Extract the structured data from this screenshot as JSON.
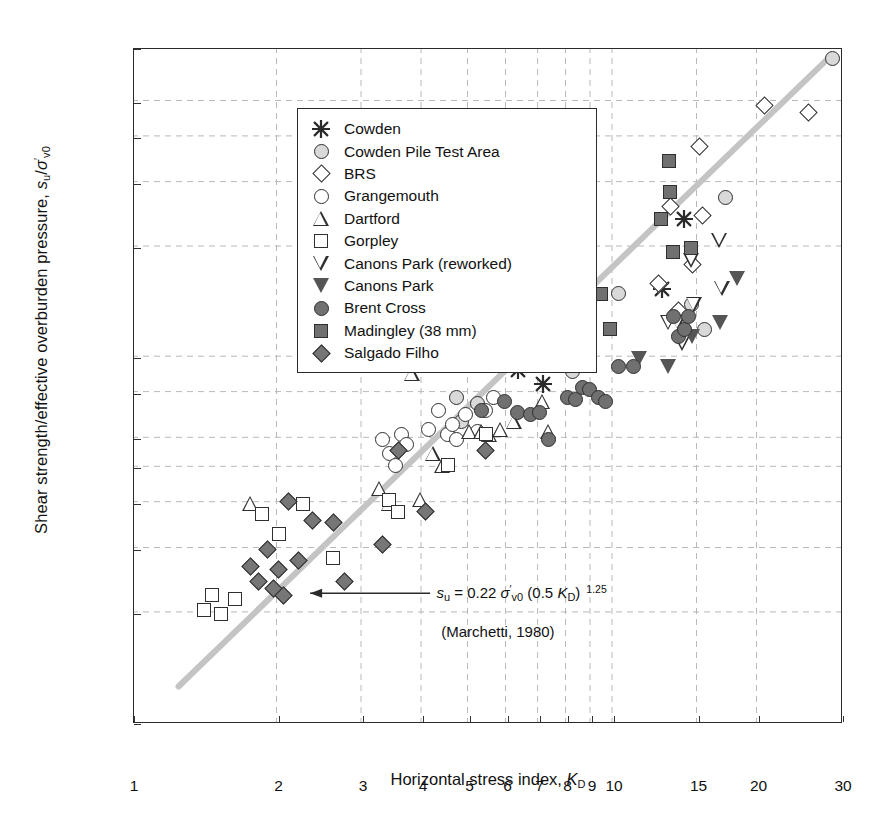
{
  "chart_data": {
    "type": "scatter",
    "title": "",
    "xlabel": "Horizontal stress index, K_D",
    "ylabel": "Shear strength/effective overburden pressure, s_u/sigma'_v0",
    "xscale": "log",
    "yscale": "log",
    "xlim": [
      1,
      30
    ],
    "ylim": [
      0.1,
      7.0
    ],
    "grid": "dashed gridlines at major ticks",
    "legend_position": "upper-left inside axes",
    "xticks": [
      "1",
      "2",
      "3",
      "4",
      "5",
      "6",
      "7",
      "8",
      "9",
      "10",
      "15",
      "20",
      "30"
    ],
    "xtick_values": [
      1,
      2,
      3,
      4,
      5,
      6,
      7,
      8,
      9,
      10,
      15,
      20,
      30
    ],
    "yticks": [
      "0.1",
      "0.2",
      "0.3",
      "0.4",
      "0.5",
      "0.6",
      "0.8",
      "1.0",
      "2.0",
      "3.0",
      "4.0",
      "5.0",
      "7.0"
    ],
    "ytick_values": [
      0.1,
      0.2,
      0.3,
      0.4,
      0.5,
      0.6,
      0.8,
      1.0,
      2.0,
      3.0,
      4.0,
      5.0,
      7.0
    ],
    "annotations": [
      {
        "name": "marchetti-equation",
        "text": "s_u = 0.22 sigma'_v0 (0.5 K_D)^1.25",
        "x": 4.3,
        "y": 0.225
      },
      {
        "name": "marchetti-reference",
        "text": "(Marchetti, 1980)",
        "x": 4.4,
        "y": 0.175
      }
    ],
    "trendline": {
      "name": "Marchetti 1980 correlation",
      "color": "#c4c4c4",
      "x": [
        1.25,
        28.5
      ],
      "y": [
        0.125,
        6.6
      ],
      "equation": "su/sv0 = 0.22 (0.5 KD)^1.25"
    },
    "series": [
      {
        "name": "Cowden",
        "marker": "asterisk",
        "fill": "#3a3a3a",
        "points": [
          [
            5.4,
            1.0
          ],
          [
            6.0,
            1.15
          ],
          [
            6.3,
            0.93
          ],
          [
            6.9,
            1.5
          ],
          [
            7.1,
            0.85
          ],
          [
            12.6,
            1.55
          ],
          [
            14.0,
            2.4
          ]
        ]
      },
      {
        "name": "Cowden Pile Test Area",
        "marker": "circle",
        "fill": "#d9d9d9",
        "points": [
          [
            4.7,
            0.78
          ],
          [
            4.8,
            0.67
          ],
          [
            5.2,
            0.75
          ],
          [
            5.9,
            1.05
          ],
          [
            6.6,
            1.15
          ],
          [
            7.1,
            1.2
          ],
          [
            8.2,
            0.92
          ],
          [
            10.2,
            1.5
          ],
          [
            14.5,
            1.4
          ],
          [
            15.4,
            1.2
          ],
          [
            17.1,
            2.75
          ],
          [
            28.5,
            6.6
          ]
        ]
      },
      {
        "name": "BRS",
        "marker": "diamond",
        "fill": "#ffffff",
        "points": [
          [
            7.9,
            1.45
          ],
          [
            8.3,
            1.35
          ],
          [
            8.8,
            1.4
          ],
          [
            12.4,
            1.6
          ],
          [
            13.1,
            2.6
          ],
          [
            13.6,
            1.35
          ],
          [
            14.6,
            1.8
          ],
          [
            15.1,
            3.8
          ],
          [
            15.3,
            2.45
          ],
          [
            20.6,
            4.9
          ],
          [
            25.4,
            4.7
          ]
        ]
      },
      {
        "name": "Grangemouth",
        "marker": "circle",
        "fill": "#ffffff",
        "points": [
          [
            3.3,
            0.6
          ],
          [
            3.4,
            0.55
          ],
          [
            3.5,
            0.51
          ],
          [
            3.6,
            0.62
          ],
          [
            3.7,
            0.58
          ],
          [
            4.1,
            0.64
          ],
          [
            4.3,
            0.72
          ],
          [
            4.5,
            0.62
          ],
          [
            4.6,
            0.66
          ],
          [
            4.7,
            0.6
          ],
          [
            4.9,
            0.7
          ],
          [
            5.2,
            0.63
          ],
          [
            5.4,
            0.72
          ],
          [
            5.6,
            0.78
          ]
        ]
      },
      {
        "name": "Dartford",
        "marker": "triangle-up",
        "fill": "#ffffff",
        "points": [
          [
            1.75,
            0.4
          ],
          [
            3.25,
            0.44
          ],
          [
            3.4,
            0.4
          ],
          [
            3.8,
            0.91
          ],
          [
            3.95,
            0.41
          ],
          [
            4.2,
            0.55
          ],
          [
            4.4,
            0.51
          ],
          [
            5.0,
            0.63
          ],
          [
            5.3,
            0.63
          ],
          [
            5.5,
            0.62
          ],
          [
            5.8,
            0.64
          ],
          [
            6.2,
            0.67
          ],
          [
            7.1,
            0.76
          ],
          [
            7.3,
            0.63
          ]
        ]
      },
      {
        "name": "Gorpley",
        "marker": "square",
        "fill": "#ffffff",
        "points": [
          [
            1.4,
            0.205
          ],
          [
            1.45,
            0.225
          ],
          [
            1.52,
            0.2
          ],
          [
            1.62,
            0.22
          ],
          [
            1.85,
            0.375
          ],
          [
            2.0,
            0.33
          ],
          [
            2.25,
            0.4
          ],
          [
            2.6,
            0.285
          ],
          [
            3.4,
            0.41
          ],
          [
            3.55,
            0.38
          ],
          [
            4.5,
            0.51
          ],
          [
            5.4,
            0.62
          ]
        ]
      },
      {
        "name": "Canons Park (reworked)",
        "marker": "triangle-down",
        "fill": "#ffffff",
        "points": [
          [
            13.0,
            1.25
          ],
          [
            13.6,
            1.25
          ],
          [
            13.9,
            1.1
          ],
          [
            14.5,
            1.85
          ],
          [
            14.7,
            1.4
          ],
          [
            16.6,
            2.1
          ],
          [
            16.8,
            1.55
          ]
        ]
      },
      {
        "name": "Canons Park",
        "marker": "triangle-down",
        "fill": "#555555",
        "points": [
          [
            11.3,
            1.0
          ],
          [
            13.0,
            0.95
          ],
          [
            14.6,
            1.15
          ],
          [
            16.7,
            1.25
          ],
          [
            18.1,
            1.65
          ]
        ]
      },
      {
        "name": "Brent Cross",
        "marker": "circle",
        "fill": "#707070",
        "points": [
          [
            5.3,
            0.72
          ],
          [
            5.9,
            0.76
          ],
          [
            6.3,
            0.71
          ],
          [
            6.7,
            0.7
          ],
          [
            7.0,
            0.71
          ],
          [
            7.3,
            0.6
          ],
          [
            8.0,
            0.78
          ],
          [
            8.3,
            0.77
          ],
          [
            8.6,
            0.83
          ],
          [
            8.9,
            0.82
          ],
          [
            9.3,
            0.78
          ],
          [
            9.6,
            0.76
          ],
          [
            10.2,
            0.95
          ],
          [
            11.0,
            0.95
          ],
          [
            13.3,
            1.3
          ],
          [
            13.6,
            1.15
          ],
          [
            14.0,
            1.2
          ],
          [
            14.3,
            1.3
          ]
        ]
      },
      {
        "name": "Madingley (38 mm)",
        "marker": "square",
        "fill": "#707070",
        "points": [
          [
            7.6,
            1.95
          ],
          [
            7.7,
            1.62
          ],
          [
            7.8,
            1.35
          ],
          [
            8.6,
            1.75
          ],
          [
            8.8,
            1.3
          ],
          [
            9.4,
            1.5
          ],
          [
            9.8,
            1.2
          ],
          [
            12.5,
            2.4
          ],
          [
            13.0,
            3.45
          ],
          [
            13.1,
            2.85
          ],
          [
            13.3,
            1.95
          ],
          [
            14.5,
            2.0
          ]
        ]
      },
      {
        "name": "Salgado Filho",
        "marker": "diamond",
        "fill": "#767676",
        "points": [
          [
            1.75,
            0.27
          ],
          [
            1.82,
            0.245
          ],
          [
            1.9,
            0.3
          ],
          [
            1.95,
            0.235
          ],
          [
            2.0,
            0.265
          ],
          [
            2.05,
            0.225
          ],
          [
            2.1,
            0.405
          ],
          [
            2.2,
            0.28
          ],
          [
            2.35,
            0.36
          ],
          [
            2.6,
            0.355
          ],
          [
            2.75,
            0.245
          ],
          [
            3.3,
            0.31
          ],
          [
            3.55,
            0.56
          ],
          [
            4.05,
            0.38
          ],
          [
            5.4,
            0.56
          ]
        ]
      }
    ]
  },
  "legend": {
    "items": [
      {
        "label": "Cowden",
        "marker": "asterisk"
      },
      {
        "label": "Cowden Pile Test Area",
        "marker": "circle"
      },
      {
        "label": "BRS",
        "marker": "diamond"
      },
      {
        "label": "Grangemouth",
        "marker": "circle"
      },
      {
        "label": "Dartford",
        "marker": "triangle-up"
      },
      {
        "label": "Gorpley",
        "marker": "square"
      },
      {
        "label": "Canons Park (reworked)",
        "marker": "triangle-down"
      },
      {
        "label": "Canons Park",
        "marker": "triangle-down"
      },
      {
        "label": "Brent Cross",
        "marker": "circle"
      },
      {
        "label": "Madingley (38 mm)",
        "marker": "square"
      },
      {
        "label": "Salgado Filho",
        "marker": "diamond"
      }
    ]
  },
  "axis_titles": {
    "x_main": "Horizontal stress index,",
    "x_symbol": "K",
    "x_symbol_sub": "D",
    "y_main": "Shear strength/effective overburden pressure,",
    "y_symbol_s": "s",
    "y_symbol_s_sub": "u",
    "y_slash": "/",
    "y_symbol_sigma": "σ",
    "y_symbol_sigma_prime": "′",
    "y_symbol_sigma_sub": "v0"
  },
  "equation": {
    "lhs_sym": "s",
    "lhs_sub": "u",
    "eq": " = 0.22 ",
    "sigma": "σ",
    "sigma_prime": "′",
    "sigma_sub": "v0",
    "paren_open": " (0.5 ",
    "kd": "K",
    "kd_sub": "D",
    "paren_close": ")",
    "exponent": "1.25",
    "reference": "(Marchetti, 1980)"
  },
  "colors": {
    "frame": "#2b2b2b",
    "grid": "#b9b9b9",
    "trendline": "#c4c4c4",
    "text": "#111111",
    "fill_light": "#d9d9d9",
    "fill_mid": "#707070",
    "fill_dark": "#555555",
    "fill_white": "#ffffff"
  },
  "caption": {
    "text": ""
  }
}
